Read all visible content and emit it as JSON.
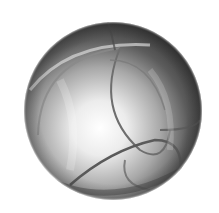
{
  "image": {
    "subject": "grayscale sphere with curved arc segments",
    "background": "#ffffff",
    "sphere": {
      "cx": 113,
      "cy": 111,
      "r": 89,
      "highlight": {
        "cx": 100,
        "cy": 128
      },
      "colors": {
        "light": "#ffffff",
        "mid": "#b0b0b0",
        "dark": "#3a3a3a",
        "edge": "#5a5a5a"
      }
    }
  }
}
